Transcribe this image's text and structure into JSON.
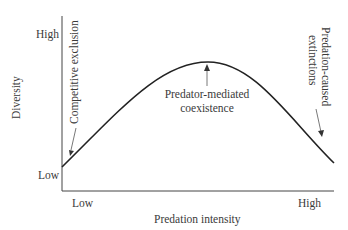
{
  "diagram": {
    "x_axis": {
      "label": "Predation intensity",
      "ticks": [
        "Low",
        "High"
      ]
    },
    "y_axis": {
      "label": "Diversity",
      "ticks": [
        "Low",
        "High"
      ]
    },
    "annotations": {
      "left": "Competitive exclusion",
      "peak_line1": "Predator-mediated",
      "peak_line2": "coexistence",
      "right_line1": "Predation-caused",
      "right_line2": "extinctions"
    },
    "curve": "hump-shaped (unimodal)"
  }
}
